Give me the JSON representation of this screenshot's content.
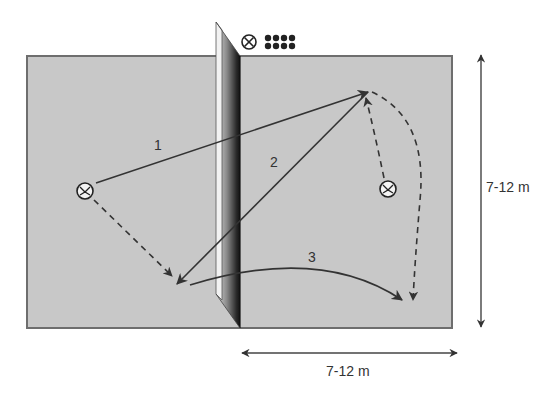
{
  "diagram": {
    "type": "volleyball drill court diagram",
    "colors": {
      "court_fill": "#c8c8c8",
      "court_border": "#6e6e6e",
      "line": "#333333",
      "background": "#ffffff"
    },
    "header_symbols": {
      "coach_icon": "circled-x-icon",
      "balls_icon": "ball-cart-icon",
      "ball_count": 8
    },
    "paths": [
      {
        "label": "1",
        "style": "solid",
        "description": "pass from left player across net to right-back corner"
      },
      {
        "label": "2",
        "style": "solid",
        "description": "return from right-back to left-front near net"
      },
      {
        "label": "3",
        "style": "solid",
        "description": "curved ball from left-front over net to right-front corner"
      }
    ],
    "movements": [
      {
        "style": "dashed",
        "description": "left player moves to front-left near net"
      },
      {
        "style": "dashed",
        "description": "right player moves up to back-right position"
      },
      {
        "style": "dashed",
        "description": "right player runs down to front-right corner"
      }
    ],
    "players": [
      {
        "id": "left-player",
        "symbol": "player-icon"
      },
      {
        "id": "right-player",
        "symbol": "player-icon"
      }
    ],
    "dimensions": {
      "vertical": "7-12 m",
      "horizontal": "7-12 m"
    }
  }
}
